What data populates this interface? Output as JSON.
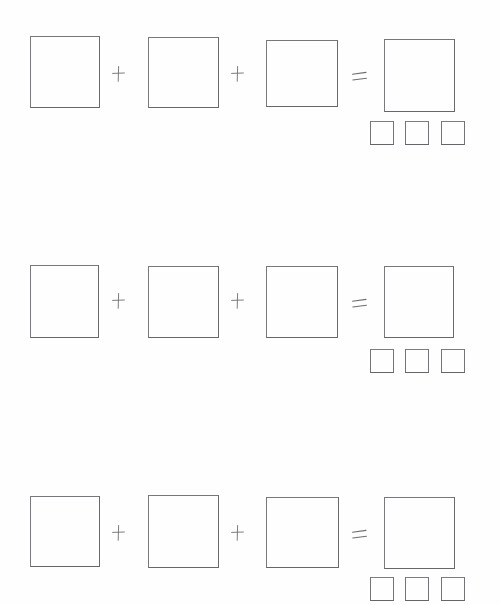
{
  "page": {
    "background_color": "#ffffff",
    "ink_color": "#6e6e72",
    "width": 500,
    "height": 605
  },
  "symbols": {
    "plus": "+",
    "equals": "=",
    "plus_icon_name": "plus-sign-icon",
    "equals_icon_name": "equals-sign-icon",
    "square_icon_name": "square-outline-icon"
  },
  "rows": [
    {
      "id": "row-1",
      "label": "Equation row 1",
      "operands": [
        {
          "name": "operand-1",
          "x": 30,
          "y": 36,
          "w": 70,
          "h": 72
        },
        {
          "name": "operand-2",
          "x": 148,
          "y": 37,
          "w": 71,
          "h": 71
        },
        {
          "name": "operand-3",
          "x": 266,
          "y": 40,
          "w": 72,
          "h": 67
        }
      ],
      "operators": [
        {
          "name": "plus-1",
          "glyph": "+",
          "x": 111,
          "y": 65
        },
        {
          "name": "plus-2",
          "glyph": "+",
          "x": 230,
          "y": 65
        },
        {
          "name": "equals-1",
          "glyph": "=",
          "x": 350,
          "y": 68
        }
      ],
      "result": {
        "name": "result-square",
        "x": 384,
        "y": 39,
        "w": 71,
        "h": 73
      },
      "units": [
        {
          "name": "unit-1",
          "x": 370,
          "y": 121,
          "w": 24,
          "h": 24
        },
        {
          "name": "unit-2",
          "x": 405,
          "y": 121,
          "w": 24,
          "h": 24
        },
        {
          "name": "unit-3",
          "x": 441,
          "y": 121,
          "w": 24,
          "h": 24
        }
      ]
    },
    {
      "id": "row-2",
      "label": "Equation row 2",
      "operands": [
        {
          "name": "operand-1",
          "x": 30,
          "y": 265,
          "w": 69,
          "h": 73
        },
        {
          "name": "operand-2",
          "x": 148,
          "y": 266,
          "w": 71,
          "h": 72
        },
        {
          "name": "operand-3",
          "x": 266,
          "y": 266,
          "w": 72,
          "h": 72
        }
      ],
      "operators": [
        {
          "name": "plus-1",
          "glyph": "+",
          "x": 111,
          "y": 292
        },
        {
          "name": "plus-2",
          "glyph": "+",
          "x": 230,
          "y": 292
        },
        {
          "name": "equals-1",
          "glyph": "=",
          "x": 350,
          "y": 295
        }
      ],
      "result": {
        "name": "result-square",
        "x": 384,
        "y": 266,
        "w": 70,
        "h": 72
      },
      "units": [
        {
          "name": "unit-1",
          "x": 370,
          "y": 349,
          "w": 24,
          "h": 24
        },
        {
          "name": "unit-2",
          "x": 405,
          "y": 349,
          "w": 24,
          "h": 24
        },
        {
          "name": "unit-3",
          "x": 441,
          "y": 349,
          "w": 24,
          "h": 24
        }
      ]
    },
    {
      "id": "row-3",
      "label": "Equation row 3",
      "operands": [
        {
          "name": "operand-1",
          "x": 30,
          "y": 496,
          "w": 70,
          "h": 71
        },
        {
          "name": "operand-2",
          "x": 148,
          "y": 495,
          "w": 71,
          "h": 73
        },
        {
          "name": "operand-3",
          "x": 266,
          "y": 497,
          "w": 73,
          "h": 71
        }
      ],
      "operators": [
        {
          "name": "plus-1",
          "glyph": "+",
          "x": 111,
          "y": 524
        },
        {
          "name": "plus-2",
          "glyph": "+",
          "x": 230,
          "y": 524
        },
        {
          "name": "equals-1",
          "glyph": "=",
          "x": 350,
          "y": 526
        }
      ],
      "result": {
        "name": "result-square",
        "x": 384,
        "y": 497,
        "w": 71,
        "h": 72
      },
      "units": [
        {
          "name": "unit-1",
          "x": 370,
          "y": 577,
          "w": 24,
          "h": 24
        },
        {
          "name": "unit-2",
          "x": 405,
          "y": 577,
          "w": 24,
          "h": 24
        },
        {
          "name": "unit-3",
          "x": 441,
          "y": 577,
          "w": 24,
          "h": 24
        }
      ]
    }
  ]
}
